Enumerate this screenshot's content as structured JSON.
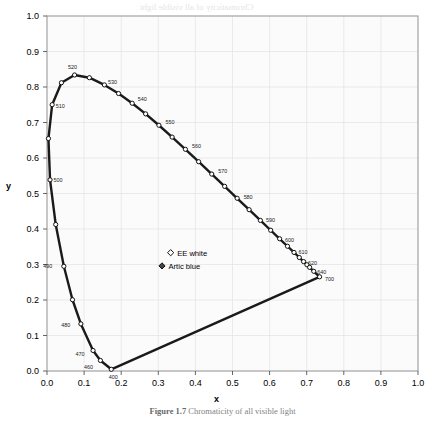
{
  "figure": {
    "axis_labels": {
      "x": "x",
      "y": "y"
    },
    "caption_prefix": "Figure 1.7",
    "caption_text": "Chromaticity of all visible light"
  },
  "chart_data": {
    "type": "line",
    "title": "",
    "xlabel": "x",
    "ylabel": "y",
    "xlim": [
      0.0,
      1.0
    ],
    "ylim": [
      0.0,
      1.0
    ],
    "grid": true,
    "legend_position": "center",
    "xticks": [
      "0.0",
      "0.1",
      "0.2",
      "0.3",
      "0.4",
      "0.5",
      "0.6",
      "0.7",
      "0.8",
      "0.9",
      "1.0"
    ],
    "yticks": [
      "0.0",
      "0.1",
      "0.2",
      "0.3",
      "0.4",
      "0.5",
      "0.6",
      "0.7",
      "0.8",
      "0.9",
      "1.0"
    ],
    "series": [
      {
        "name": "spectral locus",
        "marker": "open-circle",
        "color": "#1a1a1a",
        "points": [
          {
            "wavelength": 400,
            "x": 0.1733,
            "y": 0.0048,
            "label": "400"
          },
          {
            "wavelength": 460,
            "x": 0.144,
            "y": 0.0297,
            "label": "460"
          },
          {
            "wavelength": 470,
            "x": 0.1241,
            "y": 0.0578,
            "label": "470"
          },
          {
            "wavelength": 480,
            "x": 0.0913,
            "y": 0.1327,
            "label": "480"
          },
          {
            "wavelength": 485,
            "x": 0.0687,
            "y": 0.2007,
            "label": ""
          },
          {
            "wavelength": 490,
            "x": 0.0454,
            "y": 0.295,
            "label": "490"
          },
          {
            "wavelength": 495,
            "x": 0.0235,
            "y": 0.4127,
            "label": ""
          },
          {
            "wavelength": 500,
            "x": 0.0082,
            "y": 0.5384,
            "label": "500"
          },
          {
            "wavelength": 505,
            "x": 0.0039,
            "y": 0.6548,
            "label": ""
          },
          {
            "wavelength": 510,
            "x": 0.0139,
            "y": 0.7502,
            "label": "510"
          },
          {
            "wavelength": 515,
            "x": 0.0389,
            "y": 0.812,
            "label": ""
          },
          {
            "wavelength": 520,
            "x": 0.0743,
            "y": 0.8338,
            "label": "520"
          },
          {
            "wavelength": 525,
            "x": 0.1142,
            "y": 0.8262,
            "label": ""
          },
          {
            "wavelength": 530,
            "x": 0.1547,
            "y": 0.8059,
            "label": "530"
          },
          {
            "wavelength": 535,
            "x": 0.1929,
            "y": 0.7816,
            "label": ""
          },
          {
            "wavelength": 540,
            "x": 0.2296,
            "y": 0.7543,
            "label": "540"
          },
          {
            "wavelength": 545,
            "x": 0.2658,
            "y": 0.7243,
            "label": ""
          },
          {
            "wavelength": 550,
            "x": 0.3016,
            "y": 0.6923,
            "label": "550"
          },
          {
            "wavelength": 555,
            "x": 0.3373,
            "y": 0.6589,
            "label": ""
          },
          {
            "wavelength": 560,
            "x": 0.3731,
            "y": 0.6245,
            "label": "560"
          },
          {
            "wavelength": 565,
            "x": 0.4087,
            "y": 0.5896,
            "label": ""
          },
          {
            "wavelength": 570,
            "x": 0.4441,
            "y": 0.5547,
            "label": "570"
          },
          {
            "wavelength": 575,
            "x": 0.4788,
            "y": 0.5202,
            "label": ""
          },
          {
            "wavelength": 580,
            "x": 0.5125,
            "y": 0.4866,
            "label": "580"
          },
          {
            "wavelength": 585,
            "x": 0.5448,
            "y": 0.4544,
            "label": ""
          },
          {
            "wavelength": 590,
            "x": 0.5752,
            "y": 0.4242,
            "label": "590"
          },
          {
            "wavelength": 595,
            "x": 0.6029,
            "y": 0.3965,
            "label": ""
          },
          {
            "wavelength": 600,
            "x": 0.627,
            "y": 0.3725,
            "label": "600"
          },
          {
            "wavelength": 605,
            "x": 0.6482,
            "y": 0.3514,
            "label": ""
          },
          {
            "wavelength": 610,
            "x": 0.6658,
            "y": 0.334,
            "label": "610"
          },
          {
            "wavelength": 615,
            "x": 0.6801,
            "y": 0.3197,
            "label": ""
          },
          {
            "wavelength": 620,
            "x": 0.6915,
            "y": 0.3083,
            "label": "620"
          },
          {
            "wavelength": 625,
            "x": 0.7006,
            "y": 0.2993,
            "label": ""
          },
          {
            "wavelength": 630,
            "x": 0.7079,
            "y": 0.292,
            "label": ""
          },
          {
            "wavelength": 640,
            "x": 0.719,
            "y": 0.2809,
            "label": "640"
          },
          {
            "wavelength": 700,
            "x": 0.7347,
            "y": 0.2653,
            "label": "700"
          }
        ]
      },
      {
        "name": "purple line",
        "marker": "none",
        "color": "#1a1a1a",
        "points": [
          {
            "x": 0.7347,
            "y": 0.2653
          },
          {
            "x": 0.1733,
            "y": 0.0048
          }
        ]
      }
    ],
    "annotations": [
      {
        "name": "ee-white",
        "label": "EE white",
        "x": 0.3333,
        "y": 0.3333,
        "marker": "open-diamond"
      },
      {
        "name": "artic-blue",
        "label": "Artic blue",
        "x": 0.31,
        "y": 0.296,
        "marker": "filled-diamond"
      }
    ]
  },
  "ghost_text": [
    {
      "text": "Chromaticity of all visible light",
      "x": 140,
      "y": 2,
      "size": 9
    },
    {
      "text": "and the range of a monitor",
      "x": 170,
      "y": 16,
      "size": 8
    },
    {
      "text": "wavelength of the spectral colours",
      "x": 120,
      "y": 30,
      "size": 8
    },
    {
      "text": "the outer curved boundary of",
      "x": 135,
      "y": 44,
      "size": 8
    },
    {
      "text": "the chromaticity diagram is",
      "x": 150,
      "y": 58,
      "size": 8
    },
    {
      "text": "the spectral locus line",
      "x": 165,
      "y": 72,
      "size": 8
    },
    {
      "text": "all visible colours lie inside",
      "x": 140,
      "y": 90,
      "size": 8
    },
    {
      "text": "the horseshoe shaped region",
      "x": 150,
      "y": 104,
      "size": 8
    },
    {
      "text": "the straight line of purples",
      "x": 160,
      "y": 122,
      "size": 8
    }
  ]
}
